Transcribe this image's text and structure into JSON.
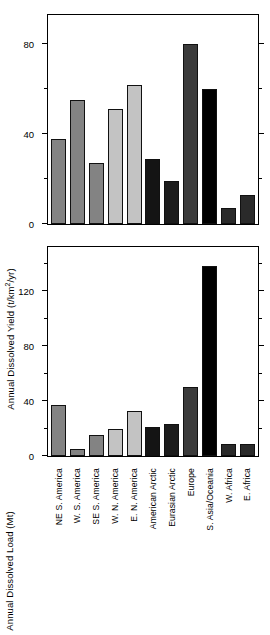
{
  "chart_data": [
    {
      "type": "bar",
      "panel": "top",
      "title": "",
      "xlabel": "",
      "ylabel": "Annual Dissolved Yield  (t/km2/yr)",
      "ylabel_text": "Annual Dissolved Yield  (t/km",
      "ylabel_sup": "2",
      "ylabel_tail": "/yr)",
      "ylim": [
        0,
        93
      ],
      "yticks": [
        0,
        40,
        80
      ],
      "ytick_labels": [
        "0",
        "40",
        "80"
      ],
      "yminor": [
        20,
        60
      ],
      "grid": false,
      "legend": "none",
      "categories": [
        "NE S. America",
        "W. S. America",
        "SE S. America",
        "W. N. America",
        "E. N. America",
        "American Arctic",
        "Eurasian Arctic",
        "Europe",
        "S. Asia/Oceania",
        "W. Africa",
        "E. Africa"
      ],
      "values": [
        38,
        55,
        27,
        51,
        62,
        29,
        19,
        80,
        60,
        7,
        13
      ],
      "bar_colors": [
        "#838383",
        "#838383",
        "#838383",
        "#c3c3c3",
        "#c3c3c3",
        "#141414",
        "#1c1c1c",
        "#3b3b3b",
        "#000000",
        "#2a2a2a",
        "#2a2a2a"
      ]
    },
    {
      "type": "bar",
      "panel": "bottom",
      "title": "",
      "xlabel": "",
      "ylabel": "Annual Dissolved Load  (Mt)",
      "ylim": [
        0,
        152
      ],
      "yticks": [
        0,
        40,
        80,
        120
      ],
      "ytick_labels": [
        "0",
        "40",
        "80",
        "120"
      ],
      "yminor": [
        20,
        60,
        100,
        140
      ],
      "grid": false,
      "legend": "none",
      "categories": [
        "NE S. America",
        "W. S. America",
        "SE S. America",
        "W. N. America",
        "E. N. America",
        "American Arctic",
        "Eurasian Arctic",
        "Europe",
        "S. Asia/Oceania",
        "W. Africa",
        "E. Africa"
      ],
      "values": [
        37,
        5,
        15,
        20,
        33,
        21,
        23,
        50,
        138,
        9,
        9
      ],
      "bar_colors": [
        "#838383",
        "#838383",
        "#838383",
        "#c3c3c3",
        "#c3c3c3",
        "#141414",
        "#1c1c1c",
        "#3b3b3b",
        "#000000",
        "#2a2a2a",
        "#2a2a2a"
      ]
    }
  ],
  "top_panel": {
    "ylabel_main": "Annual Dissolved Yield  (t/km",
    "ylabel_sup": "2",
    "ylabel_tail": "/yr)",
    "ytick_labels": [
      "0",
      "40",
      "80"
    ]
  },
  "bottom_panel": {
    "ylabel": "Annual Dissolved Load  (Mt)",
    "ytick_labels": [
      "0",
      "40",
      "80",
      "120"
    ]
  },
  "xaxis": {
    "labels": [
      "NE S. America",
      "W. S. America",
      "SE S. America",
      "W. N. America",
      "E. N. America",
      "American Arctic",
      "Eurasian Arctic",
      "Europe",
      "S. Asia/Oceania",
      "W. Africa",
      "E. Africa"
    ]
  }
}
